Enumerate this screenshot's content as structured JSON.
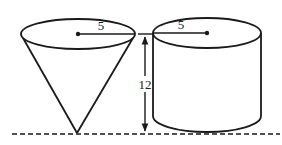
{
  "diagram": {
    "type": "geometry-solids",
    "stroke_color": "#1a1a1a",
    "background": "#ffffff",
    "cone": {
      "radius_label": "5",
      "description": "inverted cone with apex touching baseline"
    },
    "cylinder": {
      "radius_label": "5",
      "description": "upright cylinder resting on baseline"
    },
    "height_dimension": {
      "label": "12"
    },
    "baseline": {
      "style": "dashed"
    }
  }
}
